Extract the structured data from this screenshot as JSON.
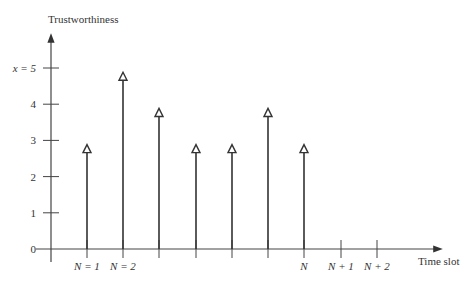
{
  "chart_data": {
    "type": "stem",
    "title": "",
    "ylabel": "Trustworthiness",
    "xlabel": "Time slot",
    "ylim": [
      0,
      5
    ],
    "y_ticks": [
      "0",
      "1",
      "2",
      "3",
      "4",
      "x = 5"
    ],
    "x_tick_labels": [
      "N = 1",
      "N = 2",
      "",
      "",
      "",
      "",
      "N",
      "N + 1",
      "N + 2"
    ],
    "values": [
      2.8,
      4.8,
      3.8,
      2.8,
      2.8,
      3.8,
      2.8,
      null,
      null
    ],
    "marker": "open-triangle",
    "grid": false,
    "legend": null
  }
}
